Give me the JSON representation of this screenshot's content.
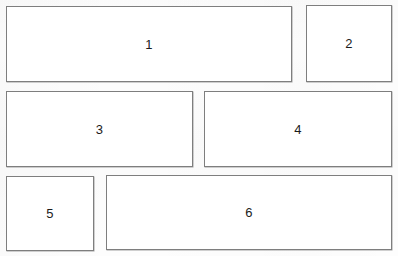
{
  "diagram": {
    "type": "panel-layout",
    "canvas": {
      "width": 398,
      "height": 256,
      "background": "#fdfdfd"
    },
    "style": {
      "border_color": "#7e7e7e",
      "border_width": 1,
      "fill": "#ffffff",
      "label_color": "#1b1b1b"
    },
    "panels": [
      {
        "id": "panel-1",
        "label": "1",
        "x": 6,
        "y": 6,
        "width": 286,
        "height": 76
      },
      {
        "id": "panel-2",
        "label": "2",
        "x": 306,
        "y": 5,
        "width": 86,
        "height": 77
      },
      {
        "id": "panel-3",
        "label": "3",
        "x": 6,
        "y": 91,
        "width": 187,
        "height": 76
      },
      {
        "id": "panel-4",
        "label": "4",
        "x": 204,
        "y": 91,
        "width": 188,
        "height": 76
      },
      {
        "id": "panel-5",
        "label": "5",
        "x": 6,
        "y": 176,
        "width": 88,
        "height": 75
      },
      {
        "id": "panel-6",
        "label": "6",
        "x": 106,
        "y": 175,
        "width": 286,
        "height": 75
      }
    ]
  }
}
